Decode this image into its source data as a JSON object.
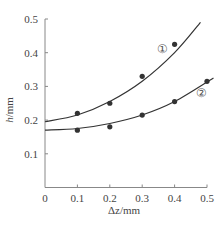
{
  "chart_data": {
    "type": "line",
    "title": "",
    "xlabel": "Δz/mm",
    "ylabel": "h/mm",
    "xlim": [
      0,
      0.5
    ],
    "ylim": [
      0,
      0.5
    ],
    "x_ticks": [
      "0",
      "0.1",
      "0.2",
      "0.3",
      "0.4",
      "0.5"
    ],
    "y_ticks": [
      "0.1",
      "0.2",
      "0.3",
      "0.4",
      "0.5"
    ],
    "grid": false,
    "legend": "inline circled labels",
    "series": [
      {
        "name": "①",
        "points": [
          [
            0.1,
            0.22
          ],
          [
            0.2,
            0.25
          ],
          [
            0.3,
            0.33
          ],
          [
            0.4,
            0.425
          ]
        ],
        "fit_curve": [
          [
            0,
            0.195
          ],
          [
            0.1,
            0.215
          ],
          [
            0.2,
            0.255
          ],
          [
            0.3,
            0.315
          ],
          [
            0.4,
            0.4
          ],
          [
            0.48,
            0.49
          ]
        ]
      },
      {
        "name": "②",
        "points": [
          [
            0.1,
            0.17
          ],
          [
            0.2,
            0.18
          ],
          [
            0.3,
            0.215
          ],
          [
            0.4,
            0.255
          ],
          [
            0.5,
            0.315
          ]
        ],
        "fit_curve": [
          [
            0,
            0.17
          ],
          [
            0.1,
            0.175
          ],
          [
            0.2,
            0.19
          ],
          [
            0.3,
            0.215
          ],
          [
            0.4,
            0.255
          ],
          [
            0.52,
            0.325
          ]
        ]
      }
    ]
  },
  "labels": {
    "xlabel": "Δz/mm",
    "ylabel_h": "h",
    "ylabel_unit": "/mm",
    "series1_marker": "①",
    "series2_marker": "②"
  }
}
